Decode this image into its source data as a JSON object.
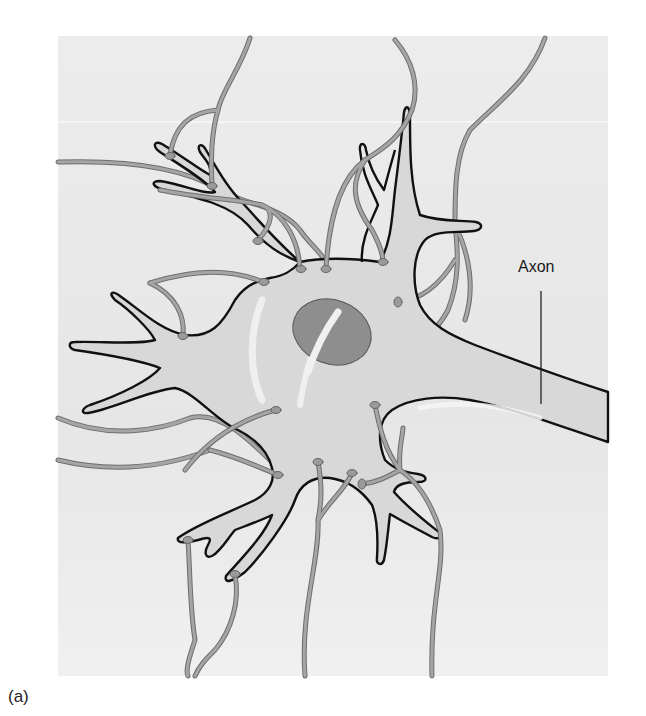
{
  "figure": {
    "panel_label": "(a)",
    "labels": {
      "axon": "Axon"
    },
    "colors": {
      "page_background": "#ffffff",
      "panel_background": "#eaeaea",
      "cell_fill": "#d9d9d9",
      "cell_outline": "#111111",
      "nucleus_fill": "#8c8c8c",
      "presynaptic_fiber": "#9a9a9a",
      "fiber_outline": "#6e6e6e",
      "highlight": "#f3f3f3"
    }
  }
}
